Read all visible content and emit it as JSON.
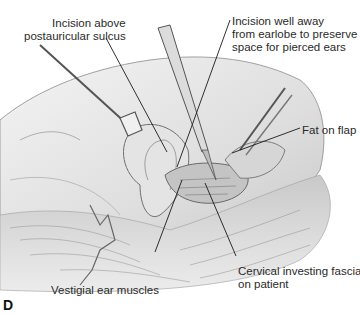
{
  "figure": {
    "panel_letter": "D",
    "labels": {
      "incision_above": {
        "line1": "Incision above",
        "line2": "postauricular sulcus"
      },
      "incision_away": {
        "line1": "Incision well away",
        "line2": "from earlobe to preserve",
        "line3": "space for pierced ears"
      },
      "fat_on_flap": {
        "line1": "Fat on flap"
      },
      "cervical_fascia": {
        "line1": "Cervical investing fascia",
        "line2": "on patient"
      },
      "vestigial_muscles": {
        "line1": "Vestigial ear muscles"
      }
    },
    "colors": {
      "line": "#1a1a1a",
      "skin": "#e9e9e9",
      "shade": "#9a9a9a",
      "hair": "#b5b5b5"
    }
  }
}
